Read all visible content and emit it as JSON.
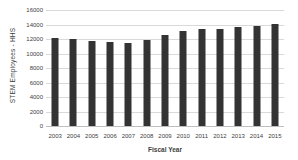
{
  "chart_data": {
    "type": "bar",
    "title": "",
    "xlabel": "Fiscal Year",
    "ylabel": "STEM Employees - HHS",
    "categories": [
      "2003",
      "2004",
      "2005",
      "2006",
      "2007",
      "2008",
      "2009",
      "2010",
      "2011",
      "2012",
      "2013",
      "2014",
      "2015"
    ],
    "values": [
      12200,
      11950,
      11750,
      11550,
      11500,
      11850,
      12500,
      13100,
      13350,
      13450,
      13650,
      13750,
      14100
    ],
    "ylim": [
      0,
      16000
    ],
    "y_ticks": [
      0,
      2000,
      4000,
      6000,
      8000,
      10000,
      12000,
      14000,
      16000
    ],
    "grid": true,
    "legend": false
  },
  "colors": {
    "bar": "#333333",
    "gridline": "#d9d9d9",
    "axis_text": "#404040",
    "background": "#ffffff"
  }
}
